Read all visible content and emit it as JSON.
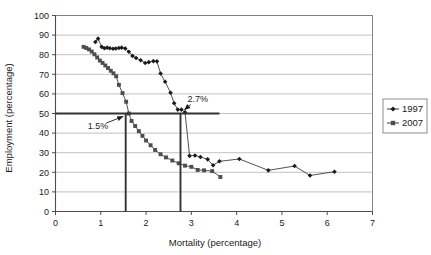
{
  "chart_data": {
    "type": "line",
    "title": "",
    "xlabel": "Mortality (percentage)",
    "ylabel": "Employment (percentage)",
    "xlim": [
      0,
      7
    ],
    "ylim": [
      0,
      100
    ],
    "xticks": [
      0,
      1,
      2,
      3,
      4,
      5,
      6,
      7
    ],
    "yticks": [
      0,
      10,
      20,
      30,
      40,
      50,
      60,
      70,
      80,
      90,
      100
    ],
    "grid": "horizontal",
    "legend_position": "right",
    "series": [
      {
        "name": "1997",
        "marker": "diamond",
        "color": "#1a1a1a",
        "points": [
          [
            0.88,
            86.5
          ],
          [
            0.94,
            88.2
          ],
          [
            1.02,
            84.0
          ],
          [
            1.08,
            83.3
          ],
          [
            1.14,
            83.6
          ],
          [
            1.2,
            83.3
          ],
          [
            1.27,
            83.0
          ],
          [
            1.33,
            83.2
          ],
          [
            1.4,
            83.4
          ],
          [
            1.46,
            83.6
          ],
          [
            1.54,
            83.2
          ],
          [
            1.62,
            81.5
          ],
          [
            1.7,
            79.4
          ],
          [
            1.78,
            78.3
          ],
          [
            1.88,
            77.2
          ],
          [
            1.98,
            75.8
          ],
          [
            2.06,
            76.2
          ],
          [
            2.16,
            76.7
          ],
          [
            2.24,
            76.6
          ],
          [
            2.32,
            70.4
          ],
          [
            2.42,
            66.2
          ],
          [
            2.54,
            60.6
          ],
          [
            2.62,
            55.2
          ],
          [
            2.7,
            52.0
          ],
          [
            2.78,
            52.0
          ],
          [
            2.86,
            50.6
          ],
          [
            2.96,
            28.4
          ],
          [
            3.08,
            28.6
          ],
          [
            3.2,
            27.8
          ],
          [
            3.36,
            26.6
          ],
          [
            3.48,
            23.6
          ],
          [
            3.62,
            25.6
          ],
          [
            4.06,
            26.8
          ],
          [
            4.7,
            21.0
          ],
          [
            5.28,
            23.2
          ],
          [
            5.62,
            18.4
          ],
          [
            6.16,
            20.3
          ]
        ]
      },
      {
        "name": "2007",
        "marker": "square",
        "color": "#4d4d4d",
        "points": [
          [
            0.62,
            84.0
          ],
          [
            0.68,
            83.4
          ],
          [
            0.74,
            82.7
          ],
          [
            0.8,
            81.6
          ],
          [
            0.86,
            80.2
          ],
          [
            0.92,
            78.6
          ],
          [
            0.98,
            77.0
          ],
          [
            1.04,
            75.8
          ],
          [
            1.1,
            74.5
          ],
          [
            1.16,
            73.2
          ],
          [
            1.22,
            71.8
          ],
          [
            1.28,
            70.5
          ],
          [
            1.34,
            69.0
          ],
          [
            1.4,
            64.6
          ],
          [
            1.48,
            60.4
          ],
          [
            1.56,
            56.0
          ],
          [
            1.62,
            50.0
          ],
          [
            1.68,
            46.2
          ],
          [
            1.76,
            43.6
          ],
          [
            1.84,
            41.0
          ],
          [
            1.92,
            38.6
          ],
          [
            2.0,
            36.2
          ],
          [
            2.1,
            33.8
          ],
          [
            2.2,
            31.4
          ],
          [
            2.32,
            29.2
          ],
          [
            2.44,
            27.6
          ],
          [
            2.58,
            26.0
          ],
          [
            2.72,
            24.6
          ],
          [
            2.86,
            23.4
          ],
          [
            3.0,
            22.8
          ],
          [
            3.14,
            21.2
          ],
          [
            3.28,
            21.0
          ],
          [
            3.46,
            20.6
          ],
          [
            3.64,
            17.6
          ]
        ]
      }
    ],
    "reference_lines": {
      "horizontal": {
        "y": 50,
        "x_start": 0,
        "x_end": 3.62
      },
      "vertical": [
        {
          "x": 1.55,
          "y_start": 0,
          "y_end": 50
        },
        {
          "x": 2.76,
          "y_start": 0,
          "y_end": 50
        }
      ]
    },
    "annotations": [
      {
        "text": "1.5%",
        "x": 0.94,
        "y": 43.5,
        "target_x": 1.55,
        "target_y": 49.0
      },
      {
        "text": "2.7%",
        "x": 3.14,
        "y": 57.5,
        "target_x": 2.8,
        "target_y": 51.0
      }
    ]
  },
  "legend": {
    "entries": [
      {
        "label": "1997"
      },
      {
        "label": "2007"
      }
    ]
  }
}
